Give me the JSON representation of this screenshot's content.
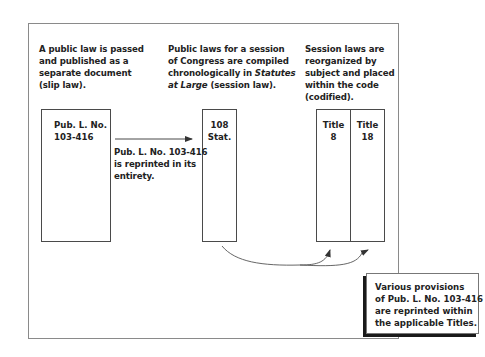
{
  "diagram": {
    "steps": [
      {
        "caption_lines": [
          "A public law is passed",
          "and published as a",
          "separate document",
          "(slip law)."
        ]
      },
      {
        "caption_lines": [
          "Public laws for a session",
          "of Congress are compiled",
          "chronologically in ",
          "(session law)."
        ],
        "caption_italic_1": "Statutes",
        "caption_italic_2": "at Large"
      },
      {
        "caption_lines": [
          "Session laws are",
          "reorganized by",
          "subject and placed",
          "within the code",
          "(codified)."
        ]
      }
    ],
    "boxes": {
      "slip_law": [
        "Pub. L. No.",
        "103-416"
      ],
      "statutes": [
        "108",
        "Stat."
      ],
      "title_a": [
        "Title",
        "8"
      ],
      "title_b": [
        "Title",
        "18"
      ]
    },
    "arrow_label": [
      "Pub. L. No. 103-416",
      "is reprinted in its",
      "entirety."
    ],
    "callout": [
      "Various provisions",
      "of Pub. L. No. 103-416",
      "are reprinted within",
      "the applicable Titles."
    ],
    "colors": {
      "frame": "#8a8a8a",
      "box_border": "#4a4a4a",
      "text": "#222222",
      "callout_shadow": "#1a1a1a"
    }
  }
}
